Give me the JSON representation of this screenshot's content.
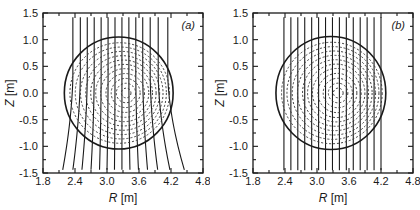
{
  "figure": {
    "name": "tokamak-equilibrium-flux-surfaces",
    "panel_count": 2
  },
  "chart_data": [
    {
      "type": "line",
      "panel": "(a)",
      "title": "",
      "xlabel": "R [m]",
      "ylabel": "Z [m]",
      "xlim": [
        1.8,
        4.8
      ],
      "ylim": [
        -1.5,
        1.5
      ],
      "xticks": [
        1.8,
        2.4,
        3.0,
        3.6,
        4.2,
        4.8
      ],
      "xticklabels": [
        "1.8",
        "2.4",
        "3.0",
        "3.6",
        "4.2",
        "4.8"
      ],
      "yticks": [
        -1.5,
        -1.0,
        -0.5,
        0.0,
        0.5,
        1.0,
        1.5
      ],
      "yticklabels": [
        "-1.5",
        "-1.0",
        "-0.5",
        "0.0",
        "0.5",
        "1.0",
        "1.5"
      ],
      "xminorticks": [
        2.1,
        2.7,
        3.3,
        3.9,
        4.5
      ],
      "yminorticks": [
        -1.25,
        -0.75,
        -0.25,
        0.25,
        0.75,
        1.25
      ],
      "grid": false,
      "legend": null,
      "series": [
        {
          "name": "plasma-boundary",
          "style": "solid",
          "description": "circular plasma boundary",
          "center_R": 3.22,
          "center_Z": 0.0,
          "radius_R": 1.02,
          "radius_Z": 1.05
        },
        {
          "name": "flux-surfaces",
          "style": "dashed",
          "description": "nested magnetic flux surfaces with outward Shafranov shift",
          "count": 11,
          "magnetic_axis_R": 3.36,
          "magnetic_axis_Z": 0.0,
          "normalized_radii": [
            0.93,
            0.85,
            0.77,
            0.69,
            0.61,
            0.53,
            0.45,
            0.36,
            0.27,
            0.18,
            0.09
          ]
        },
        {
          "name": "vertical-field-lines",
          "style": "solid",
          "description": "field lines flaring outward below the plasma",
          "count": 14,
          "top_Z": 1.42,
          "bottom_Z": -1.44,
          "top_R": [
            2.36,
            2.5,
            2.63,
            2.76,
            2.89,
            3.02,
            3.15,
            3.28,
            3.41,
            3.54,
            3.67,
            3.81,
            3.96,
            4.14
          ],
          "bottom_R": [
            2.17,
            2.36,
            2.53,
            2.7,
            2.86,
            3.0,
            3.14,
            3.28,
            3.43,
            3.59,
            3.76,
            3.95,
            4.18,
            4.45
          ],
          "flare": "outward-bottom"
        }
      ]
    },
    {
      "type": "line",
      "panel": "(b)",
      "title": "",
      "xlabel": "R [m]",
      "ylabel": "Z [m]",
      "xlim": [
        1.8,
        4.8
      ],
      "ylim": [
        -1.5,
        1.5
      ],
      "xticks": [
        1.8,
        2.4,
        3.0,
        3.6,
        4.2,
        4.8
      ],
      "xticklabels": [
        "1.8",
        "2.4",
        "3.0",
        "3.6",
        "4.2",
        "4.8"
      ],
      "yticks": [
        -1.5,
        -1.0,
        -0.5,
        0.0,
        0.5,
        1.0,
        1.5
      ],
      "yticklabels": [
        "-1.5",
        "-1.0",
        "-0.5",
        "0.0",
        "0.5",
        "1.0",
        "1.5"
      ],
      "xminorticks": [
        2.1,
        2.7,
        3.3,
        3.9,
        4.5
      ],
      "yminorticks": [
        -1.25,
        -0.75,
        -0.25,
        0.25,
        0.75,
        1.25
      ],
      "grid": false,
      "legend": null,
      "series": [
        {
          "name": "plasma-boundary",
          "style": "solid",
          "description": "circular plasma boundary",
          "center_R": 3.26,
          "center_Z": 0.0,
          "radius_R": 1.03,
          "radius_Z": 1.06
        },
        {
          "name": "flux-surfaces",
          "style": "dashed",
          "description": "nested magnetic flux surfaces with outward Shafranov shift",
          "count": 11,
          "magnetic_axis_R": 3.4,
          "magnetic_axis_Z": 0.0,
          "normalized_radii": [
            0.93,
            0.85,
            0.77,
            0.69,
            0.61,
            0.53,
            0.45,
            0.36,
            0.27,
            0.18,
            0.09
          ]
        },
        {
          "name": "vertical-field-lines",
          "style": "solid",
          "description": "perfectly straight vertical field lines",
          "count": 15,
          "top_Z": 1.42,
          "bottom_Z": -1.45,
          "R_positions": [
            2.38,
            2.51,
            2.64,
            2.77,
            2.9,
            3.03,
            3.16,
            3.29,
            3.42,
            3.55,
            3.68,
            3.81,
            3.94,
            4.07,
            4.2
          ],
          "flare": "none"
        }
      ]
    }
  ],
  "panels": [
    {
      "tag": "(a)",
      "xlabel_var": "R",
      "xlabel_unit": "[m]",
      "ylabel_var": "Z",
      "ylabel_unit": "[m]"
    },
    {
      "tag": "(b)",
      "xlabel_var": "R",
      "xlabel_unit": "[m]",
      "ylabel_var": "Z",
      "ylabel_unit": "[m]"
    }
  ],
  "colors": {
    "line": "#1a1a1a",
    "dashed": "#3a3a3a",
    "axis": "#1a1a1a",
    "background": "#ffffff"
  }
}
